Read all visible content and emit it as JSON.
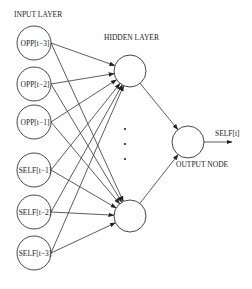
{
  "diagram": {
    "title_input": "INPUT LAYER",
    "title_hidden": "HIDDEN LAYER",
    "title_output": "OUTPUT NODE",
    "output_label": "SELF[t]",
    "input_nodes": [
      {
        "label": "OPP[t−3]",
        "cx": 34,
        "cy": 43
      },
      {
        "label": "OPP[t−2]",
        "cx": 34,
        "cy": 84
      },
      {
        "label": "OPP[t−1]",
        "cx": 34,
        "cy": 122
      },
      {
        "label": "SELF[t−1]",
        "cx": 34,
        "cy": 170
      },
      {
        "label": "SELF[t−2]",
        "cx": 34,
        "cy": 212
      },
      {
        "label": "SELF[t−3]",
        "cx": 34,
        "cy": 253
      }
    ],
    "hidden_nodes": [
      {
        "cx": 130,
        "cy": 71
      },
      {
        "cx": 130,
        "cy": 216
      }
    ],
    "output_node": {
      "cx": 188,
      "cy": 142
    },
    "ellipsis_dots": [
      {
        "cx": 125,
        "cy": 129
      },
      {
        "cx": 125,
        "cy": 144
      },
      {
        "cx": 125,
        "cy": 159
      }
    ],
    "colors": {
      "stroke": "#333333",
      "background": "#ffffff"
    }
  }
}
